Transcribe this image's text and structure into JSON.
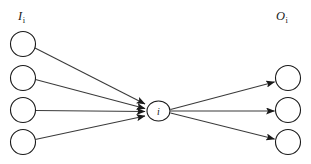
{
  "figure": {
    "type": "node-link-diagram",
    "background_color": "#ffffff",
    "stroke_color": "#1a1a1a",
    "edge_color": "#3a3a3a",
    "width": 311,
    "height": 164
  },
  "labels": {
    "input_group": {
      "base": "I",
      "subscript": "i"
    },
    "output_group": {
      "base": "O",
      "subscript": "i"
    }
  },
  "hidden_node": {
    "id": "i",
    "label": "i",
    "cx": 158.5,
    "cy": 111,
    "rx": 11.5,
    "ry": 10
  },
  "input_nodes": [
    {
      "id": "in-1",
      "cx": 23,
      "cy": 44,
      "r": 12.5
    },
    {
      "id": "in-2",
      "cx": 23,
      "cy": 78,
      "r": 12.5
    },
    {
      "id": "in-3",
      "cx": 23,
      "cy": 110,
      "r": 12.5
    },
    {
      "id": "in-4",
      "cx": 23,
      "cy": 142,
      "r": 12.5
    }
  ],
  "output_nodes": [
    {
      "id": "out-1",
      "cx": 288,
      "cy": 78,
      "r": 12.5
    },
    {
      "id": "out-2",
      "cx": 288,
      "cy": 110,
      "r": 12.5
    },
    {
      "id": "out-3",
      "cx": 288,
      "cy": 142,
      "r": 12.5
    }
  ],
  "incoming_edges": [
    {
      "id": "edge-in-1",
      "from": "in-1",
      "to": "i",
      "x1": 35.0,
      "y1": 48.0,
      "x2": 145.0,
      "y2": 104.0
    },
    {
      "id": "edge-in-2",
      "from": "in-2",
      "to": "i",
      "x1": 35.4,
      "y1": 79.5,
      "x2": 145.0,
      "y2": 108.5
    },
    {
      "id": "edge-in-3",
      "from": "in-3",
      "to": "i",
      "x1": 35.5,
      "y1": 110.5,
      "x2": 145.0,
      "y2": 111.5
    },
    {
      "id": "edge-in-4",
      "from": "in-4",
      "to": "i",
      "x1": 35.2,
      "y1": 139.5,
      "x2": 145.0,
      "y2": 116.0
    }
  ],
  "outgoing_edges": [
    {
      "id": "edge-out-1",
      "from": "i",
      "to": "out-1",
      "x1": 170.5,
      "y1": 109.5,
      "x2": 274.5,
      "y2": 82.0
    },
    {
      "id": "edge-out-2",
      "from": "i",
      "to": "out-2",
      "x1": 170.5,
      "y1": 111.0,
      "x2": 274.5,
      "y2": 111.0
    },
    {
      "id": "edge-out-3",
      "from": "i",
      "to": "out-3",
      "x1": 170.5,
      "y1": 113.0,
      "x2": 274.5,
      "y2": 139.0
    }
  ],
  "label_positions": {
    "input_group": {
      "x": 18,
      "y": 20
    },
    "output_group": {
      "x": 276,
      "y": 20
    }
  }
}
